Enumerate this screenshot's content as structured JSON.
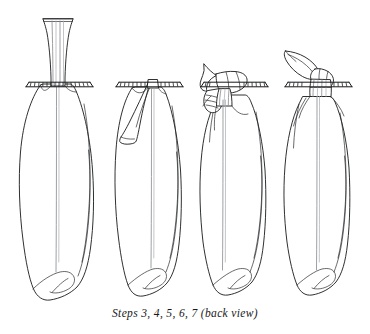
{
  "figure": {
    "kind": "line-art-instructional-diagram",
    "caption": "Steps 3, 4, 5, 6, 7 (back view)",
    "background_color": "#ffffff",
    "ink_color": "#17181a",
    "soft_ink_color": "#8d8f93",
    "panel_count": 4,
    "panels": [
      {
        "index": 1,
        "name": "step-3-straight-stem",
        "label": "straight gathered stem above ribbed bar",
        "stem_state": "upright",
        "bar_present": true
      },
      {
        "index": 2,
        "name": "step-4-stem-folded-left",
        "label": "stem folded down to the left over the bar",
        "stem_state": "folded-left",
        "bar_present": true
      },
      {
        "index": 3,
        "name": "step-5-6-stem-wrapped",
        "label": "stem wrapped and looped around the bar",
        "stem_state": "wrapped-knot",
        "bar_present": true
      },
      {
        "index": 4,
        "name": "step-7-stem-tied-angled",
        "label": "stem tied off and angled up to the left",
        "stem_state": "tied-angled-up-left",
        "bar_present": true
      }
    ]
  }
}
